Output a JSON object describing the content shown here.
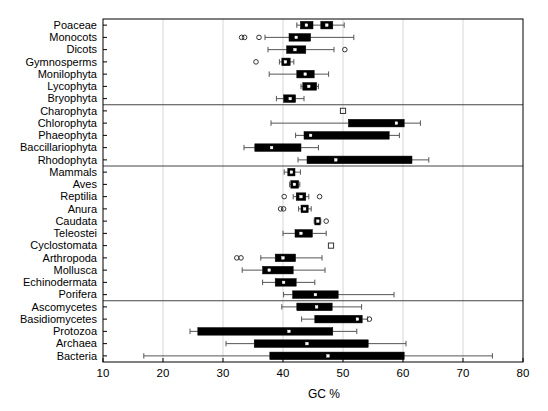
{
  "chart_data": {
    "type": "boxplot",
    "title": "",
    "xlabel": "GC %",
    "ylabel": "",
    "xlim": [
      10,
      80
    ],
    "xticks": [
      10,
      20,
      30,
      40,
      50,
      60,
      70,
      80
    ],
    "xticklabels": [
      "10",
      "20",
      "30",
      "40",
      "50",
      "60",
      "70",
      "80"
    ],
    "grid": "vertical-light",
    "orientation": "horizontal",
    "legend": "none",
    "median_marker": "white square",
    "box_fill": "#000000",
    "outlier_marker": "open circle / open square",
    "group_separators_after": [
      "Bryophyta",
      "Rhodophyta",
      "Porifera"
    ],
    "categories": [
      "Poaceae",
      "Monocots",
      "Dicots",
      "Gymnosperms",
      "Monilophyta",
      "Lycophyta",
      "Bryophyta",
      "Charophyta",
      "Chlorophyta",
      "Phaeophyta",
      "Baccillariophyta",
      "Rhodophyta",
      "Mammals",
      "Aves",
      "Reptilia",
      "Anura",
      "Caudata",
      "Teleostei",
      "Cyclostomata",
      "Arthropoda",
      "Mollusca",
      "Echinodermata",
      "Porifera",
      "Ascomycetes",
      "Basidiomycetes",
      "Protozoa",
      "Archaea",
      "Bacteria"
    ],
    "boxes": [
      {
        "label": "Poaceae",
        "whislo": 42.3,
        "q1": 42.9,
        "med": 43.9,
        "q3": 45.0,
        "whishi": 50.2,
        "outliers": [],
        "extra_box": {
          "q1": 46.3,
          "med": 47.3,
          "q3": 48.3
        }
      },
      {
        "label": "Monocots",
        "whislo": 37.0,
        "q1": 41.0,
        "med": 42.2,
        "q3": 44.6,
        "whishi": 51.8,
        "outliers": [
          33.1,
          33.6,
          36.0
        ]
      },
      {
        "label": "Dicots",
        "whislo": 37.5,
        "q1": 40.6,
        "med": 42.0,
        "q3": 43.8,
        "whishi": 48.5,
        "outliers": [
          50.3
        ]
      },
      {
        "label": "Gymnosperms",
        "whislo": 39.4,
        "q1": 39.8,
        "med": 40.4,
        "q3": 41.2,
        "whishi": 41.8,
        "outliers": [
          35.5
        ]
      },
      {
        "label": "Monilophyta",
        "whislo": 37.7,
        "q1": 42.3,
        "med": 43.7,
        "q3": 45.2,
        "whishi": 47.6,
        "outliers": []
      },
      {
        "label": "Lycophyta",
        "whislo": 43.0,
        "q1": 43.3,
        "med": 44.3,
        "q3": 45.6,
        "whishi": 45.9,
        "outliers": []
      },
      {
        "label": "Bryophyta",
        "whislo": 38.9,
        "q1": 40.1,
        "med": 41.2,
        "q3": 42.1,
        "whishi": 43.5,
        "outliers": []
      },
      {
        "label": "Charophyta",
        "whislo": 50.0,
        "q1": 50.0,
        "med": 50.0,
        "q3": 50.0,
        "whishi": 50.0,
        "outliers": [
          50.0
        ],
        "single_point": true
      },
      {
        "label": "Chlorophyta",
        "whislo": 38.0,
        "q1": 50.9,
        "med": 58.9,
        "q3": 60.2,
        "whishi": 62.9,
        "outliers": []
      },
      {
        "label": "Phaeophyta",
        "whislo": 42.1,
        "q1": 43.5,
        "med": 44.6,
        "q3": 57.7,
        "whishi": 59.4,
        "outliers": []
      },
      {
        "label": "Baccillariophyta",
        "whislo": 33.5,
        "q1": 35.3,
        "med": 38.1,
        "q3": 43.0,
        "whishi": 45.9,
        "outliers": []
      },
      {
        "label": "Rhodophyta",
        "whislo": 42.5,
        "q1": 44.0,
        "med": 48.8,
        "q3": 61.5,
        "whishi": 64.3,
        "outliers": []
      },
      {
        "label": "Mammals",
        "whislo": 40.2,
        "q1": 40.8,
        "med": 41.4,
        "q3": 42.0,
        "whishi": 42.9,
        "outliers": []
      },
      {
        "label": "Aves",
        "whislo": 41.1,
        "q1": 41.3,
        "med": 41.9,
        "q3": 42.6,
        "whishi": 42.8,
        "outliers": []
      },
      {
        "label": "Reptilia",
        "whislo": 41.7,
        "q1": 42.2,
        "med": 43.0,
        "q3": 43.8,
        "whishi": 44.3,
        "outliers": [
          40.2,
          46.1
        ]
      },
      {
        "label": "Anura",
        "whislo": 42.6,
        "q1": 43.0,
        "med": 43.6,
        "q3": 44.2,
        "whishi": 44.7,
        "outliers": [
          39.6,
          40.1
        ]
      },
      {
        "label": "Caudata",
        "whislo": 45.2,
        "q1": 45.3,
        "med": 45.8,
        "q3": 46.2,
        "whishi": 46.3,
        "outliers": [
          47.2
        ]
      },
      {
        "label": "Teleostei",
        "whislo": 40.0,
        "q1": 42.0,
        "med": 43.0,
        "q3": 44.9,
        "whishi": 47.2,
        "outliers": []
      },
      {
        "label": "Cyclostomata",
        "whislo": 48.0,
        "q1": 48.0,
        "med": 48.0,
        "q3": 48.0,
        "whishi": 48.0,
        "outliers": [
          48.0
        ],
        "single_point": true
      },
      {
        "label": "Arthropoda",
        "whislo": 36.3,
        "q1": 38.7,
        "med": 40.0,
        "q3": 42.1,
        "whishi": 46.5,
        "outliers": [
          32.3,
          33.0
        ]
      },
      {
        "label": "Mollusca",
        "whislo": 33.2,
        "q1": 36.6,
        "med": 37.7,
        "q3": 41.7,
        "whishi": 47.0,
        "outliers": []
      },
      {
        "label": "Echinodermata",
        "whislo": 36.6,
        "q1": 38.7,
        "med": 40.1,
        "q3": 42.2,
        "whishi": 45.3,
        "outliers": []
      },
      {
        "label": "Porifera",
        "whislo": 40.1,
        "q1": 41.6,
        "med": 45.4,
        "q3": 49.2,
        "whishi": 58.5,
        "outliers": []
      },
      {
        "label": "Ascomycetes",
        "whislo": 39.8,
        "q1": 42.3,
        "med": 45.6,
        "q3": 48.2,
        "whishi": 53.1,
        "outliers": []
      },
      {
        "label": "Basidiomycetes",
        "whislo": 43.1,
        "q1": 45.3,
        "med": 52.4,
        "q3": 53.2,
        "whishi": 54.1,
        "outliers": [
          54.4
        ]
      },
      {
        "label": "Protozoa",
        "whislo": 24.5,
        "q1": 25.8,
        "med": 41.0,
        "q3": 48.3,
        "whishi": 52.3,
        "outliers": []
      },
      {
        "label": "Archaea",
        "whislo": 30.5,
        "q1": 35.2,
        "med": 44.0,
        "q3": 54.2,
        "whishi": 60.5,
        "outliers": []
      },
      {
        "label": "Bacteria",
        "whislo": 16.8,
        "q1": 37.8,
        "med": 47.5,
        "q3": 60.2,
        "whishi": 74.9,
        "outliers": []
      }
    ]
  },
  "axis": {
    "x_title": "GC %",
    "x_tick_labels": [
      "10",
      "20",
      "30",
      "40",
      "50",
      "60",
      "70",
      "80"
    ]
  },
  "colors": {
    "box": "#000000",
    "line": "#555555",
    "frame": "#000000",
    "grid": "#cccccc",
    "median": "#ffffff",
    "background": "#ffffff"
  }
}
